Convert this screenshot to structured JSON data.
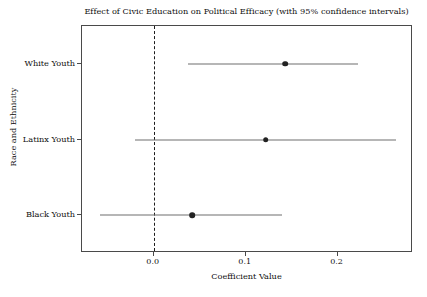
{
  "chart_data": {
    "type": "scatter",
    "title": "Effect of Civic Education on Political Efficacy (with 95% confidence intervals)",
    "xlabel": "Coefficient Value",
    "ylabel": "Race and Ethnicity",
    "categories": [
      "White Youth",
      "Latinx Youth",
      "Black Youth"
    ],
    "values": [
      0.143,
      0.122,
      0.042
    ],
    "ci_low": [
      0.037,
      -0.02,
      -0.058
    ],
    "ci_high": [
      0.222,
      0.263,
      0.14
    ],
    "series": [
      {
        "name": "Coefficient estimate with 95% CI",
        "points": [
          {
            "category": "White Youth",
            "estimate": 0.143,
            "ci_low": 0.037,
            "ci_high": 0.222
          },
          {
            "category": "Latinx Youth",
            "estimate": 0.122,
            "ci_low": -0.02,
            "ci_high": 0.263
          },
          {
            "category": "Black Youth",
            "estimate": 0.042,
            "ci_low": -0.058,
            "ci_high": 0.14
          }
        ]
      }
    ],
    "xticks": [
      0.0,
      0.1,
      0.2
    ],
    "xtick_labels": [
      "0.0",
      "0.1",
      "0.2"
    ],
    "xlim": [
      -0.078,
      0.282
    ],
    "grid": false,
    "legend": "none",
    "reference_line": {
      "value": 0.0,
      "style": "dashed",
      "color": "#1c1c1c"
    },
    "point_color": "#222222",
    "line_color": "#6f6f6f"
  }
}
